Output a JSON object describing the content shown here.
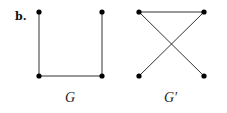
{
  "panel_label": "b.",
  "graphs": [
    {
      "name": "G",
      "label": "G",
      "nodes": [
        {
          "id": "tl",
          "x": 39,
          "y": 12
        },
        {
          "id": "tr",
          "x": 102,
          "y": 12
        },
        {
          "id": "bl",
          "x": 39,
          "y": 76
        },
        {
          "id": "br",
          "x": 102,
          "y": 76
        }
      ],
      "edges": [
        [
          "tl",
          "bl"
        ],
        [
          "bl",
          "br"
        ],
        [
          "br",
          "tr"
        ]
      ]
    },
    {
      "name": "G-prime",
      "label": "G′",
      "nodes": [
        {
          "id": "tl",
          "x": 139,
          "y": 12
        },
        {
          "id": "tr",
          "x": 204,
          "y": 12
        },
        {
          "id": "bl",
          "x": 139,
          "y": 76
        },
        {
          "id": "br",
          "x": 204,
          "y": 76
        }
      ],
      "edges": [
        [
          "tl",
          "tr"
        ],
        [
          "tl",
          "br"
        ],
        [
          "tr",
          "bl"
        ]
      ]
    }
  ],
  "colors": {
    "node": "#000000",
    "edge": "#333333",
    "background": "#ffffff"
  }
}
